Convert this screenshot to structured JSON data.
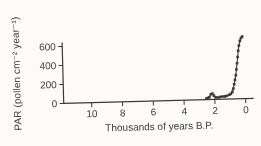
{
  "figure": {
    "background": "#fcfbf8",
    "ink": "#3a3a3a",
    "text_color": "#3c3c3c"
  },
  "chart_data": {
    "type": "line",
    "title": "",
    "xlabel": "Thousands of years B.P.",
    "ylabel": "PAR (pollen cm⁻² year⁻¹)",
    "x_axis": {
      "ticks": [
        10,
        8,
        6,
        4,
        2,
        0
      ],
      "range": [
        11.8,
        -0.5
      ],
      "reversed": true
    },
    "y_axis": {
      "ticks": [
        0,
        200,
        400,
        600
      ],
      "range": [
        0,
        680
      ]
    },
    "grid": false,
    "legend": "none",
    "marker": "filled-square",
    "series": [
      {
        "name": "PAR",
        "points": [
          [
            2.55,
            12
          ],
          [
            2.45,
            18
          ],
          [
            2.35,
            25
          ],
          [
            2.25,
            55
          ],
          [
            2.15,
            62
          ],
          [
            2.05,
            40
          ],
          [
            1.95,
            22
          ],
          [
            1.8,
            20
          ],
          [
            1.65,
            25
          ],
          [
            1.5,
            28
          ],
          [
            1.35,
            30
          ],
          [
            1.2,
            35
          ],
          [
            1.05,
            45
          ],
          [
            0.95,
            55
          ],
          [
            0.85,
            75
          ],
          [
            0.78,
            110
          ],
          [
            0.72,
            155
          ],
          [
            0.66,
            200
          ],
          [
            0.6,
            250
          ],
          [
            0.55,
            310
          ],
          [
            0.5,
            375
          ],
          [
            0.45,
            440
          ],
          [
            0.4,
            505
          ],
          [
            0.35,
            560
          ],
          [
            0.28,
            610
          ],
          [
            0.2,
            640
          ],
          [
            0.12,
            655
          ]
        ]
      }
    ]
  }
}
